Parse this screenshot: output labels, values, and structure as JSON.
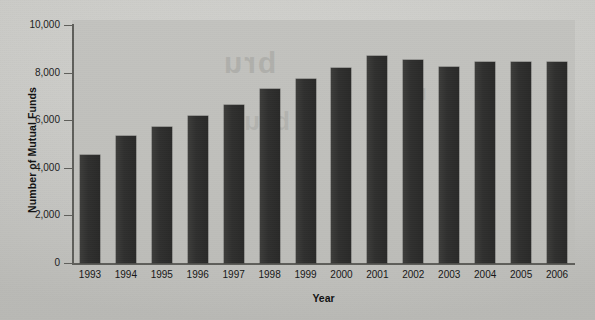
{
  "chart_data": {
    "type": "bar",
    "title": "",
    "xlabel": "Year",
    "ylabel": "Number of Mutual Funds",
    "categories": [
      "1993",
      "1994",
      "1995",
      "1996",
      "1997",
      "1998",
      "1999",
      "2000",
      "2001",
      "2002",
      "2003",
      "2004",
      "2005",
      "2006"
    ],
    "values": [
      4558,
      5325,
      5725,
      6160,
      6625,
      7300,
      7750,
      8180,
      8700,
      8550,
      8250,
      8430,
      8450,
      8450
    ],
    "ylim": [
      0,
      10000
    ],
    "ytick_labels": [
      "10,000",
      "8,000",
      "6,000",
      "4,000",
      "2,000",
      "0"
    ],
    "ytick_values": [
      10000,
      8000,
      6000,
      4000,
      2000,
      0
    ],
    "grid": false,
    "legend": null,
    "bar_color": "#2f2f2e",
    "plot_background": "#c0c0bc",
    "page_background": "#c9c9c5"
  },
  "watermarks": {
    "line1": "bru",
    "line2": "bru",
    "line3": "nt"
  }
}
